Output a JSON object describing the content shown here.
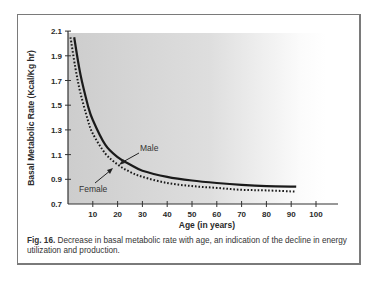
{
  "figure": {
    "label": "Fig. 16.",
    "caption": "Decrease in basal metabolic rate with age, an indication of the decline in energy utilization and production."
  },
  "chart_data": {
    "type": "line",
    "title": "",
    "xlabel": "Age (in years)",
    "ylabel": "Basal Metabolic Rate (Kcal/Kg hr)",
    "xlim": [
      0,
      108
    ],
    "ylim": [
      0.7,
      2.1
    ],
    "x_ticks": [
      10,
      20,
      30,
      40,
      50,
      60,
      70,
      80,
      90,
      100
    ],
    "y_ticks": [
      2.1,
      1.9,
      1.7,
      1.5,
      1.3,
      1.1,
      0.9,
      0.7
    ],
    "grid": false,
    "legend": "inline annotations with arrows",
    "series": [
      {
        "name": "Male",
        "style": "solid",
        "color": "#1a1a1a",
        "x": [
          2.5,
          5,
          8,
          10,
          15,
          20,
          25,
          30,
          40,
          50,
          60,
          70,
          80,
          92
        ],
        "values": [
          2.05,
          1.75,
          1.5,
          1.38,
          1.18,
          1.08,
          1.02,
          0.97,
          0.92,
          0.89,
          0.87,
          0.855,
          0.845,
          0.84
        ]
      },
      {
        "name": "Female",
        "style": "dotted",
        "color": "#1a1a1a",
        "x": [
          1,
          3,
          5,
          8,
          10,
          15,
          20,
          25,
          30,
          40,
          50,
          60,
          70,
          80,
          92
        ],
        "values": [
          2.05,
          1.8,
          1.6,
          1.38,
          1.27,
          1.11,
          1.02,
          0.96,
          0.92,
          0.87,
          0.845,
          0.83,
          0.815,
          0.81,
          0.8
        ]
      }
    ],
    "annotations": [
      {
        "text": "Male",
        "arrow_to_x": 20,
        "arrow_to_y": 1.07
      },
      {
        "text": "Female",
        "arrow_to_x": 18,
        "arrow_to_y": 1.03
      }
    ]
  },
  "colors": {
    "plot_bg_left": "#cfcfcf",
    "plot_bg_right": "#ffffff",
    "frame": "#7a7a7a",
    "line": "#1a1a1a"
  }
}
